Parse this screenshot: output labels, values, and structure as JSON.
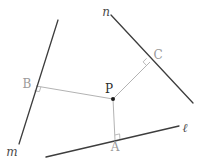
{
  "canvas": {
    "width": 204,
    "height": 167,
    "background": "#ffffff"
  },
  "colors": {
    "main_line": "#3d3d3d",
    "perpendicular_segment": "#b3b3b3",
    "right_angle_marker": "#b3b3b3",
    "main_label": "#4a4a4a",
    "foot_label": "#9a9a9a",
    "point_label": "#2b2b2b",
    "point_dot": "#1a1a1a"
  },
  "diagram": {
    "lines": [
      {
        "name": "line-m",
        "label": "m",
        "x1": 58,
        "y1": 20,
        "x2": 19,
        "y2": 144,
        "label_x": 12,
        "label_y": 156
      },
      {
        "name": "line-n",
        "label": "n",
        "x1": 111,
        "y1": 15,
        "x2": 193,
        "y2": 103,
        "label_x": 106,
        "label_y": 16
      },
      {
        "name": "line-l",
        "label": "ℓ",
        "x1": 46,
        "y1": 157,
        "x2": 179,
        "y2": 126,
        "label_x": 185,
        "label_y": 132
      }
    ],
    "point": {
      "name": "point-P",
      "label": "P",
      "x": 113,
      "y": 99,
      "r": 2,
      "label_x": 109,
      "label_y": 93
    },
    "perpendiculars": [
      {
        "name": "foot-B",
        "label": "B",
        "foot_x": 36,
        "foot_y": 86,
        "label_x": 27,
        "label_y": 88,
        "right_angle": "34.5,90.8 39.4,91.6 40.9,86.8"
      },
      {
        "name": "foot-C",
        "label": "C",
        "foot_x": 150,
        "foot_y": 62,
        "label_x": 158,
        "label_y": 59,
        "right_angle": "146.6,58.3 143.1,61.9 146.5,65.5"
      },
      {
        "name": "foot-A",
        "label": "A",
        "foot_x": 115,
        "foot_y": 140,
        "label_x": 115,
        "label_y": 151,
        "right_angle": "119.9,138.9 119.6,133.9 114.8,135.0"
      }
    ]
  }
}
